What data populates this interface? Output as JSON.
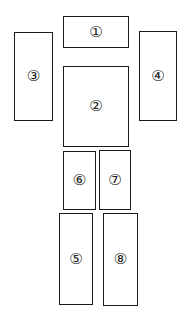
{
  "diagram": {
    "boxes": [
      {
        "id": "1",
        "label": "①",
        "x": 63,
        "y": 16,
        "w": 66,
        "h": 32
      },
      {
        "id": "2",
        "label": "②",
        "x": 63,
        "y": 66,
        "w": 66,
        "h": 81
      },
      {
        "id": "3",
        "label": "③",
        "x": 14,
        "y": 32,
        "w": 39,
        "h": 89
      },
      {
        "id": "4",
        "label": "④",
        "x": 139,
        "y": 31,
        "w": 38,
        "h": 90
      },
      {
        "id": "5",
        "label": "⑤",
        "x": 59,
        "y": 213,
        "w": 34,
        "h": 92
      },
      {
        "id": "6",
        "label": "⑥",
        "x": 63,
        "y": 151,
        "w": 33,
        "h": 59
      },
      {
        "id": "7",
        "label": "⑦",
        "x": 99,
        "y": 150,
        "w": 32,
        "h": 60
      },
      {
        "id": "8",
        "label": "⑧",
        "x": 103,
        "y": 213,
        "w": 35,
        "h": 93
      }
    ]
  }
}
